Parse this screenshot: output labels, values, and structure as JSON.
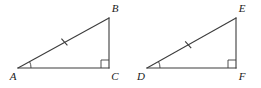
{
  "figure": {
    "kind": "geometry-diagram",
    "width": 261,
    "height": 88,
    "background_color": "#ffffff",
    "stroke_color": "#3c3c3c",
    "label_color": "#1a1a1a"
  },
  "triangles": [
    {
      "id": "ABC",
      "vertices": [
        {
          "name": "A",
          "label": "A",
          "x": 18,
          "y": 68,
          "label_x": 13,
          "label_y": 80
        },
        {
          "name": "B",
          "label": "B",
          "x": 109,
          "y": 18,
          "label_x": 113,
          "label_y": 12
        },
        {
          "name": "C",
          "label": "C",
          "x": 109,
          "y": 68,
          "label_x": 113,
          "label_y": 80
        }
      ],
      "edges": [
        {
          "from": "A",
          "to": "B",
          "role": "hypotenuse",
          "ticks": 1
        },
        {
          "from": "B",
          "to": "C",
          "role": "leg",
          "ticks": 0
        },
        {
          "from": "A",
          "to": "C",
          "role": "leg",
          "ticks": 0
        }
      ],
      "angle_arc": {
        "at": "A",
        "radius": 13
      },
      "right_angle": {
        "at": "C",
        "size": 8
      },
      "tick_mark": {
        "on_edge": "AB",
        "position": 0.52,
        "length": 9
      }
    },
    {
      "id": "DEF",
      "vertices": [
        {
          "name": "D",
          "label": "D",
          "x": 147,
          "y": 68,
          "label_x": 141,
          "label_y": 80
        },
        {
          "name": "E",
          "label": "E",
          "x": 236,
          "y": 18,
          "label_x": 240,
          "label_y": 12
        },
        {
          "name": "F",
          "label": "F",
          "x": 236,
          "y": 68,
          "label_x": 240,
          "label_y": 80
        }
      ],
      "edges": [
        {
          "from": "D",
          "to": "E",
          "role": "hypotenuse",
          "ticks": 1
        },
        {
          "from": "E",
          "to": "F",
          "role": "leg",
          "ticks": 0
        },
        {
          "from": "D",
          "to": "F",
          "role": "leg",
          "ticks": 0
        }
      ],
      "angle_arc": {
        "at": "D",
        "radius": 13
      },
      "right_angle": {
        "at": "F",
        "size": 8
      },
      "tick_mark": {
        "on_edge": "DE",
        "position": 0.46,
        "length": 9
      }
    }
  ]
}
